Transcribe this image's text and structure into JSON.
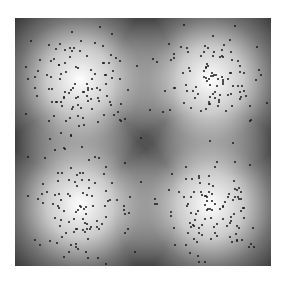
{
  "chart_data": {
    "type": "scatter",
    "title": "",
    "xlabel": "",
    "ylabel": "",
    "grid": false,
    "legend": null,
    "background": "heatmap",
    "colormap": "grayscale",
    "colors": {
      "low": "#2a2a2a",
      "high": "#ffffff",
      "dot": "#1a1a1a",
      "page": "#ffffff"
    },
    "plot_area": {
      "left": 15,
      "top": 18,
      "width": 256,
      "height": 248
    },
    "clusters": [
      {
        "name": "top-left",
        "cx": 65,
        "cy": 62,
        "sigma": 28,
        "n_points": 110
      },
      {
        "name": "top-right",
        "cx": 195,
        "cy": 62,
        "sigma": 28,
        "n_points": 110
      },
      {
        "name": "bottom-left",
        "cx": 65,
        "cy": 187,
        "sigma": 28,
        "n_points": 110
      },
      {
        "name": "bottom-right",
        "cx": 195,
        "cy": 187,
        "sigma": 28,
        "n_points": 110
      }
    ]
  }
}
